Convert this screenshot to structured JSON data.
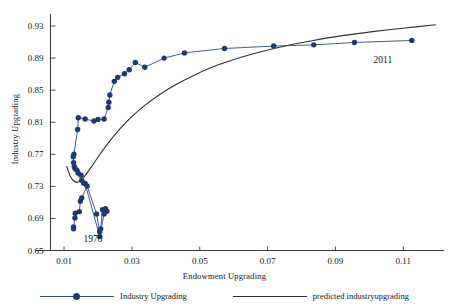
{
  "chart_data": {
    "type": "line",
    "title": "",
    "xlabel": "Endowment Upgrading",
    "ylabel": "Industry Upgrading",
    "xlim": [
      0.006,
      0.122
    ],
    "ylim": [
      0.65,
      0.945
    ],
    "xticks": [
      0.01,
      0.03,
      0.05,
      0.07,
      0.09,
      0.11
    ],
    "xticklabels": [
      "0.01",
      "0.03",
      "0.05",
      "0.07",
      "0.09",
      "0.11"
    ],
    "yticks": [
      0.65,
      0.69,
      0.73,
      0.77,
      0.81,
      0.85,
      0.89,
      0.93
    ],
    "yticklabels": [
      "0.65",
      "0.69",
      "0.73",
      "0.77",
      "0.81",
      "0.85",
      "0.89",
      "0.93"
    ],
    "grid": false,
    "legend_position": "below-axis",
    "colors": {
      "series": "#2e4a86",
      "marker": "#1f3a70",
      "predicted": "#30322f",
      "axis": "#3a3a3a",
      "text": "#141414"
    },
    "annotations": [
      {
        "text": "1970",
        "x": 0.0185,
        "y": 0.6605
      },
      {
        "text": "2011",
        "x": 0.104,
        "y": 0.8835
      }
    ],
    "series": [
      {
        "name": "Industry Upgrading",
        "type": "line-markers",
        "marker": "filled-circle",
        "points": [
          [
            0.0128,
            0.677
          ],
          [
            0.0128,
            0.6795
          ],
          [
            0.0132,
            0.6905
          ],
          [
            0.0133,
            0.6965
          ],
          [
            0.0145,
            0.6985
          ],
          [
            0.0148,
            0.7115
          ],
          [
            0.0152,
            0.7155
          ],
          [
            0.0168,
            0.7305
          ],
          [
            0.0196,
            0.6955
          ],
          [
            0.0205,
            0.6735
          ],
          [
            0.0208,
            0.677
          ],
          [
            0.0213,
            0.701
          ],
          [
            0.0222,
            0.702
          ],
          [
            0.0226,
            0.699
          ],
          [
            0.0218,
            0.6955
          ],
          [
            0.0205,
            0.6675
          ],
          [
            0.0162,
            0.7335
          ],
          [
            0.0158,
            0.734
          ],
          [
            0.0152,
            0.7375
          ],
          [
            0.015,
            0.744
          ],
          [
            0.0142,
            0.7465
          ],
          [
            0.0138,
            0.75
          ],
          [
            0.0133,
            0.752
          ],
          [
            0.013,
            0.7545
          ],
          [
            0.0128,
            0.7595
          ],
          [
            0.0127,
            0.767
          ],
          [
            0.0129,
            0.77
          ],
          [
            0.014,
            0.801
          ],
          [
            0.0142,
            0.8155
          ],
          [
            0.0162,
            0.814
          ],
          [
            0.0188,
            0.8115
          ],
          [
            0.02,
            0.8135
          ],
          [
            0.0218,
            0.814
          ],
          [
            0.023,
            0.8285
          ],
          [
            0.0232,
            0.835
          ],
          [
            0.0235,
            0.844
          ],
          [
            0.0248,
            0.861
          ],
          [
            0.0258,
            0.866
          ],
          [
            0.0278,
            0.8705
          ],
          [
            0.0292,
            0.8755
          ],
          [
            0.031,
            0.8845
          ],
          [
            0.0338,
            0.8785
          ],
          [
            0.0395,
            0.89
          ],
          [
            0.0455,
            0.8965
          ],
          [
            0.0573,
            0.902
          ],
          [
            0.0718,
            0.905
          ],
          [
            0.0836,
            0.9065
          ],
          [
            0.0956,
            0.9095
          ],
          [
            0.1125,
            0.912
          ]
        ]
      },
      {
        "name": "predicted industryupgrading",
        "type": "line",
        "marker": "none",
        "points": [
          [
            0.0108,
            0.755
          ],
          [
            0.0118,
            0.743
          ],
          [
            0.0128,
            0.737
          ],
          [
            0.0138,
            0.735
          ],
          [
            0.015,
            0.7375
          ],
          [
            0.0165,
            0.745
          ],
          [
            0.0185,
            0.757
          ],
          [
            0.0205,
            0.7695
          ],
          [
            0.023,
            0.784
          ],
          [
            0.026,
            0.7995
          ],
          [
            0.0295,
            0.815
          ],
          [
            0.0335,
            0.83
          ],
          [
            0.038,
            0.844
          ],
          [
            0.043,
            0.857
          ],
          [
            0.0485,
            0.869
          ],
          [
            0.0545,
            0.88
          ],
          [
            0.061,
            0.8895
          ],
          [
            0.068,
            0.898
          ],
          [
            0.0755,
            0.9055
          ],
          [
            0.0835,
            0.912
          ],
          [
            0.092,
            0.918
          ],
          [
            0.101,
            0.923
          ],
          [
            0.1105,
            0.9275
          ],
          [
            0.1195,
            0.9315
          ]
        ]
      }
    ]
  },
  "legend": {
    "items": [
      {
        "label": "Industry Upgrading",
        "style": "line-marker"
      },
      {
        "label": "predicted industryupgrading",
        "style": "line"
      }
    ]
  }
}
